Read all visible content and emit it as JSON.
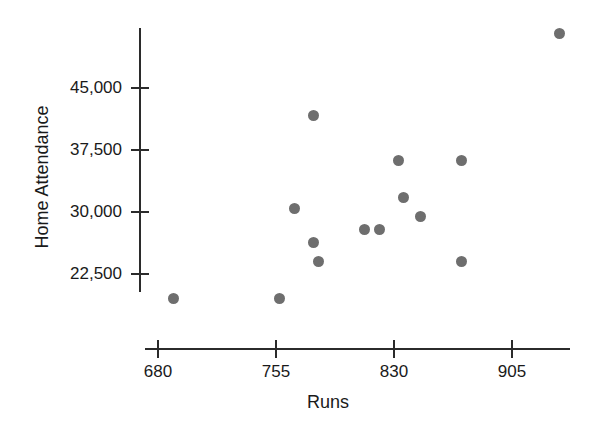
{
  "chart_data": {
    "type": "scatter",
    "title": "",
    "xlabel": "Runs",
    "ylabel": "Home Attendance",
    "xlim": [
      655,
      923
    ],
    "ylim": [
      16200,
      53500
    ],
    "grid": false,
    "legend": "none",
    "marker_color": "#6e6e6e",
    "axis_color": "#2b2b2b",
    "x_ticks": [
      680,
      755,
      830,
      905
    ],
    "x_tick_labels": [
      "680",
      "755",
      "830",
      "905"
    ],
    "y_ticks": [
      22500,
      30000,
      37500,
      45000
    ],
    "y_tick_labels": [
      "22,500",
      "30,000",
      "37,500",
      "45,000"
    ],
    "points": [
      {
        "x": 690,
        "y": 19500
      },
      {
        "x": 757,
        "y": 19500
      },
      {
        "x": 779,
        "y": 41700
      },
      {
        "x": 767,
        "y": 30400
      },
      {
        "x": 779,
        "y": 26300
      },
      {
        "x": 782,
        "y": 24000
      },
      {
        "x": 811,
        "y": 27900
      },
      {
        "x": 821,
        "y": 27900
      },
      {
        "x": 833,
        "y": 36200
      },
      {
        "x": 836,
        "y": 31700
      },
      {
        "x": 847,
        "y": 29400
      },
      {
        "x": 873,
        "y": 36200
      },
      {
        "x": 873,
        "y": 24000
      },
      {
        "x": 935,
        "y": 51600
      }
    ]
  },
  "axes": {
    "x_title": "Runs",
    "y_title": "Home Attendance"
  }
}
